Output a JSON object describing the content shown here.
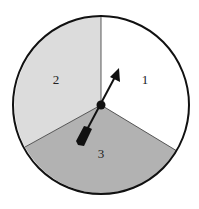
{
  "spinner": {
    "sections": [
      {
        "label": "1",
        "color": "#ffffff"
      },
      {
        "label": "2",
        "color": "#dcdcdc"
      },
      {
        "label": "3",
        "color": "#b2b2b2"
      }
    ],
    "outline_color": "#111111",
    "arrow_color": "#111111"
  }
}
